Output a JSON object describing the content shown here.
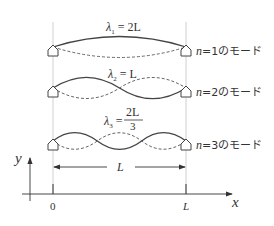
{
  "diagram": {
    "modes": [
      {
        "n": 1,
        "lambda_sym": "λ",
        "sub": "1",
        "eq": " = 2L",
        "caption_n": "n",
        "caption_rest": "=1のモード"
      },
      {
        "n": 2,
        "lambda_sym": "λ",
        "sub": "2",
        "eq": " = L",
        "caption_n": "n",
        "caption_rest": "=2のモード"
      },
      {
        "n": 3,
        "lambda_sym": "λ",
        "sub": "3",
        "eq": " = ",
        "frac_num": "2L",
        "frac_den": "3",
        "caption_n": "n",
        "caption_rest": "=3のモード"
      }
    ],
    "length_label": "L",
    "axes": {
      "x_label": "x",
      "y_label": "y",
      "tick_0": "0",
      "tick_L": "L"
    },
    "colors": {
      "line": "#444444",
      "guide": "#cccccc"
    }
  }
}
